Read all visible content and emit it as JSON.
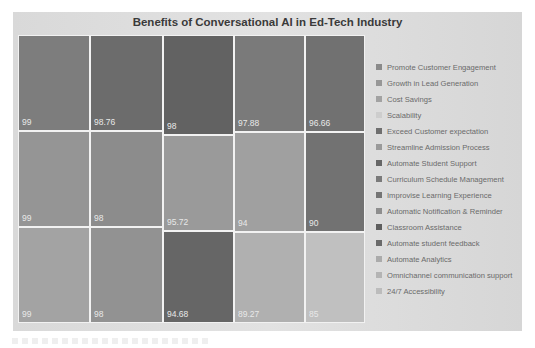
{
  "chart_data": {
    "type": "treemap",
    "title": "Benefits of Conversational AI in Ed-Tech Industry",
    "layout": {
      "rows": 3,
      "cols": 5,
      "legend_position": "right",
      "grid": false
    },
    "cells": [
      {
        "row": 0,
        "col": 0,
        "value": 99,
        "label": "99",
        "color": "#7d7d7d"
      },
      {
        "row": 0,
        "col": 1,
        "value": 98.76,
        "label": "98.76",
        "color": "#6c6c6c"
      },
      {
        "row": 0,
        "col": 2,
        "value": 98,
        "label": "98",
        "color": "#626262"
      },
      {
        "row": 0,
        "col": 3,
        "value": 97.88,
        "label": "97.88",
        "color": "#7a7a7a"
      },
      {
        "row": 0,
        "col": 4,
        "value": 96.66,
        "label": "96.66",
        "color": "#717171"
      },
      {
        "row": 1,
        "col": 0,
        "value": 99,
        "label": "99",
        "color": "#959595"
      },
      {
        "row": 1,
        "col": 1,
        "value": 98,
        "label": "98",
        "color": "#8c8c8c"
      },
      {
        "row": 1,
        "col": 2,
        "value": 95.72,
        "label": "95.72",
        "color": "#9a9a9a"
      },
      {
        "row": 1,
        "col": 3,
        "value": 94,
        "label": "94",
        "color": "#a0a0a0"
      },
      {
        "row": 1,
        "col": 4,
        "value": 90,
        "label": "90",
        "color": "#727272"
      },
      {
        "row": 2,
        "col": 0,
        "value": 99,
        "label": "99",
        "color": "#a3a3a3"
      },
      {
        "row": 2,
        "col": 1,
        "value": 98,
        "label": "98",
        "color": "#929292"
      },
      {
        "row": 2,
        "col": 2,
        "value": 94.68,
        "label": "94.68",
        "color": "#666666"
      },
      {
        "row": 2,
        "col": 3,
        "value": 89.27,
        "label": "89.27",
        "color": "#b0b0b0"
      },
      {
        "row": 2,
        "col": 4,
        "value": 85,
        "label": "85",
        "color": "#c0c0c0"
      }
    ],
    "legend": [
      {
        "label": "Promote Customer Engagement",
        "color": "#8a8a8a"
      },
      {
        "label": "Growth in Lead Generation",
        "color": "#979797"
      },
      {
        "label": "Cost Savings",
        "color": "#a2a2a2"
      },
      {
        "label": "Scalability",
        "color": "#cdcdcd"
      },
      {
        "label": "Exceed Customer expectation",
        "color": "#6f6f6f"
      },
      {
        "label": "Streamline Admission Process",
        "color": "#9a9a9a"
      },
      {
        "label": "Automate Student Support",
        "color": "#666666"
      },
      {
        "label": "Curriculum Schedule Management",
        "color": "#7a7a7a"
      },
      {
        "label": "Improvise Learning Experience",
        "color": "#747474"
      },
      {
        "label": "Automatic Notification & Reminder",
        "color": "#8e8e8e"
      },
      {
        "label": "Classroom Assistance",
        "color": "#5e5e5e"
      },
      {
        "label": "Automate student feedback",
        "color": "#6a6a6a"
      },
      {
        "label": "Automate Analytics",
        "color": "#ababab"
      },
      {
        "label": "Omnichannel communication support",
        "color": "#b4b4b4"
      },
      {
        "label": "24/7 Accessibility",
        "color": "#bcbcbc"
      }
    ]
  }
}
